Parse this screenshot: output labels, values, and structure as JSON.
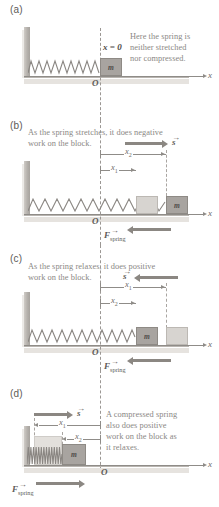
{
  "figure": {
    "axis_label": "x",
    "origin_label": "O",
    "block_label": "m",
    "equilibrium_label": "x = 0",
    "vector_s": "s",
    "vector_f": "F",
    "vector_f_sub": "spring",
    "x1_label": "x",
    "x1_sub": "1",
    "x2_label": "x",
    "x2_sub": "2"
  },
  "panels": [
    {
      "id": "a",
      "label": "(a)",
      "caption_lines": [
        "Here the spring is",
        "neither stretched",
        "nor compressed."
      ],
      "state": "equilibrium",
      "spring_state": "natural",
      "has_s_vector": false,
      "has_f_vector": false
    },
    {
      "id": "b",
      "label": "(b)",
      "caption_lines": [
        "As the spring stretches, it does negative",
        "work on the block."
      ],
      "state": "stretching",
      "spring_state": "stretched",
      "has_s_vector": true,
      "s_direction": "right",
      "has_f_vector": true,
      "f_direction": "left",
      "measures": [
        {
          "name": "x1",
          "from": "origin",
          "to": "ghost-block"
        },
        {
          "name": "x2",
          "from": "origin",
          "to": "solid-block"
        }
      ]
    },
    {
      "id": "c",
      "label": "(c)",
      "caption_lines": [
        "As the spring relaxes, it does positive",
        "work on the block."
      ],
      "state": "relaxing",
      "spring_state": "stretched",
      "has_s_vector": true,
      "s_direction": "left",
      "has_f_vector": true,
      "f_direction": "left",
      "measures": [
        {
          "name": "x1",
          "from": "origin",
          "to": "ghost-block"
        },
        {
          "name": "x2",
          "from": "origin",
          "to": "solid-block"
        }
      ]
    },
    {
      "id": "d",
      "label": "(d)",
      "caption_lines": [
        "A compressed spring",
        "also does positive",
        "work on the block as",
        "it relaxes."
      ],
      "state": "compressed",
      "spring_state": "compressed",
      "has_s_vector": true,
      "s_direction": "right",
      "has_f_vector": true,
      "f_direction": "right",
      "measures": [
        {
          "name": "x1",
          "from": "ghost-block",
          "to": "origin"
        },
        {
          "name": "x2",
          "from": "solid-block",
          "to": "origin"
        }
      ]
    }
  ],
  "colors": {
    "ink": "#6d6a66",
    "caption": "#8a8784",
    "block_fill": "#a8a4a0",
    "block_ghost": "#d7d4d0",
    "wall": "#b5b1ac",
    "ground": "#b9b5b0",
    "vector": "#8b8782"
  }
}
